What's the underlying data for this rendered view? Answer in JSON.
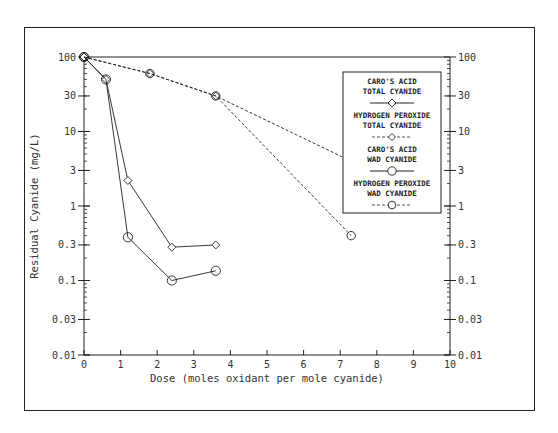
{
  "chart_data": {
    "type": "line",
    "title": "",
    "xlabel": "Dose (moles oxidant per mole cyanide)",
    "ylabel": "Residual Cyanide (mg/L)",
    "xlim": [
      0,
      10
    ],
    "ylim": [
      0.01,
      100
    ],
    "yscale": "log",
    "x_ticks": [
      "0",
      "1",
      "2",
      "3",
      "4",
      "5",
      "6",
      "7",
      "8",
      "9",
      "10"
    ],
    "y_ticks": [
      "100",
      "30",
      "10",
      "3",
      "1",
      "0.3",
      "0.1",
      "0.03",
      "0.01"
    ],
    "grid": false,
    "legend_position": "upper right (inside)",
    "series": [
      {
        "name": "CARO'S ACID TOTAL CYANIDE",
        "line": "solid",
        "marker": "diamond",
        "x": [
          0,
          0.6,
          1.2,
          2.4,
          3.6
        ],
        "values": [
          100,
          50,
          2.2,
          0.28,
          0.3
        ]
      },
      {
        "name": "HYDROGEN PEROXIDE TOTAL CYANIDE",
        "line": "dashed",
        "marker": "diamond",
        "x": [
          0,
          1.8,
          3.6,
          7.3
        ],
        "values": [
          100,
          60,
          30,
          4
        ]
      },
      {
        "name": "CARO'S ACID WAD CYANIDE",
        "line": "solid",
        "marker": "circle",
        "x": [
          0,
          0.6,
          1.2,
          2.4,
          3.6
        ],
        "values": [
          100,
          50,
          0.38,
          0.1,
          0.135
        ]
      },
      {
        "name": "HYDROGEN PEROXIDE WAD CYANIDE",
        "line": "dashed",
        "marker": "circle",
        "x": [
          0,
          1.8,
          3.6,
          7.3
        ],
        "values": [
          100,
          60,
          30,
          0.4
        ]
      }
    ]
  },
  "legend": [
    {
      "line1": "CARO'S ACID",
      "line2": "TOTAL CYANIDE"
    },
    {
      "line1": "HYDROGEN PEROXIDE",
      "line2": "TOTAL CYANIDE"
    },
    {
      "line1": "CARO'S ACID",
      "line2": "WAD CYANIDE"
    },
    {
      "line1": "HYDROGEN PEROXIDE",
      "line2": "WAD CYANIDE"
    }
  ]
}
